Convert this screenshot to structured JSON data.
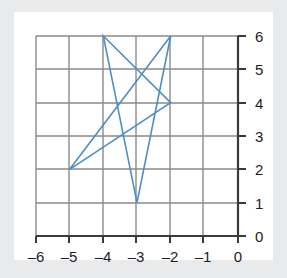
{
  "chart_data": {
    "type": "line",
    "title": "",
    "xlabel": "",
    "ylabel": "",
    "xlim": [
      -6,
      0
    ],
    "ylim": [
      0,
      6
    ],
    "xticks": [
      -6,
      -5,
      -4,
      -3,
      -2,
      -1,
      0
    ],
    "yticks": [
      0,
      1,
      2,
      3,
      4,
      5,
      6
    ],
    "xtick_labels": [
      "–6",
      "–5",
      "–4",
      "–3",
      "–2",
      "–1",
      "0"
    ],
    "ytick_labels": [
      "0",
      "1",
      "2",
      "3",
      "4",
      "5",
      "6"
    ],
    "grid": true,
    "legend": null,
    "x_axis_position": "bottom",
    "y_axis_position": "right",
    "series": [
      {
        "name": "star-polygon",
        "type": "closed-polyline",
        "closed": true,
        "color": "#4e8ec4",
        "points": [
          {
            "x": -4,
            "y": 6
          },
          {
            "x": -2,
            "y": 4
          },
          {
            "x": -5,
            "y": 2
          },
          {
            "x": -2,
            "y": 6
          },
          {
            "x": -3,
            "y": 1
          },
          {
            "x": -4,
            "y": 6
          }
        ],
        "vertices": [
          {
            "x": -4,
            "y": 6
          },
          {
            "x": -2,
            "y": 6
          },
          {
            "x": -2,
            "y": 4
          },
          {
            "x": -5,
            "y": 2
          },
          {
            "x": -3,
            "y": 1
          }
        ]
      }
    ]
  },
  "colors": {
    "line": "#4e8ec4",
    "grid": "#8a8a8a",
    "axis": "#3a3a3a",
    "plot_background": "#ffffff",
    "page_background": "#e9eaec",
    "tick_text": "#1d1d1d"
  },
  "figure": {
    "caption": ""
  }
}
